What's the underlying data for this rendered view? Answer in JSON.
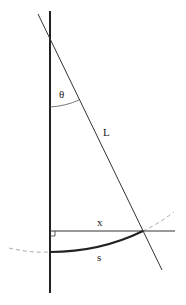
{
  "diagram": {
    "labels": {
      "angle": "θ",
      "length": "L",
      "horizontal": "x",
      "arc": "s"
    },
    "colors": {
      "line": "#333333",
      "thick_line": "#222222",
      "dashed_arc": "#aaaaaa",
      "background": "#ffffff"
    },
    "elements": [
      {
        "name": "vertical-axis",
        "type": "line",
        "from": [
          50,
          11
        ],
        "to": [
          50,
          293
        ]
      },
      {
        "name": "pendulum-string",
        "type": "line",
        "from": [
          38,
          14
        ],
        "to": [
          162,
          270
        ]
      },
      {
        "name": "horizontal-displacement",
        "type": "line",
        "from": [
          50,
          231
        ],
        "to": [
          175,
          231
        ]
      },
      {
        "name": "arc-path",
        "type": "arc",
        "from": [
          50,
          252
        ],
        "to": [
          143,
          231
        ]
      },
      {
        "name": "angle-arc",
        "type": "arc",
        "from": [
          50,
          107
        ],
        "to": [
          79,
          100
        ]
      },
      {
        "name": "right-angle-marker",
        "type": "square",
        "at": [
          50,
          231
        ],
        "size": 5
      }
    ]
  }
}
